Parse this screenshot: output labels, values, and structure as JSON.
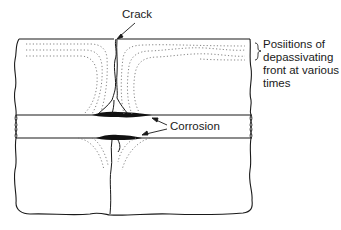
{
  "diagram": {
    "title": "",
    "labels": {
      "crack": "Crack",
      "corrosion": "Corrosion",
      "positions": [
        "Posiitions of",
        "depassivating",
        "front at various",
        "times"
      ]
    },
    "components": [
      "concrete-section",
      "crack",
      "reinforcing-bar",
      "corrosion-zones",
      "depassivating-front-lines"
    ],
    "colors": {
      "line": "#1a1a1a",
      "dotted": "#777777",
      "corrosion": "#111111",
      "background": "#ffffff"
    }
  }
}
